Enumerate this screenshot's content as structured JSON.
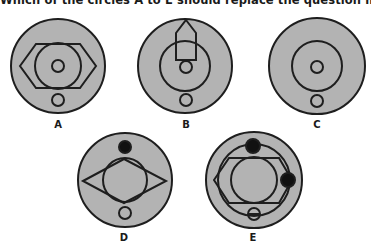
{
  "question": {
    "text": "Which of the circles A to E should replace the question mark in the diagram?"
  },
  "colors": {
    "fill": "#b3b3b3",
    "stroke": "#1e1e1e",
    "dot": "#111111",
    "background": "#ffffff"
  },
  "options": [
    {
      "label": "A",
      "elements": [
        "outer-circle",
        "horizontal-hexagon",
        "inner-circle",
        "center-small-circle",
        "bottom-small-circle"
      ]
    },
    {
      "label": "B",
      "elements": [
        "outer-circle",
        "vertical-pentagon-arrow",
        "inner-circle",
        "center-small-circle",
        "bottom-small-circle"
      ]
    },
    {
      "label": "C",
      "elements": [
        "outer-circle",
        "inner-circle",
        "center-small-circle",
        "bottom-small-circle"
      ]
    },
    {
      "label": "D",
      "elements": [
        "outer-circle",
        "top-black-dot",
        "horizontal-rhombus",
        "inner-circle",
        "bottom-small-circle"
      ]
    },
    {
      "label": "E",
      "elements": [
        "outer-circle",
        "ring-circle",
        "top-black-dot",
        "right-black-dot",
        "horizontal-hexagon",
        "inner-circle",
        "bottom-small-circle-crossed"
      ]
    }
  ]
}
